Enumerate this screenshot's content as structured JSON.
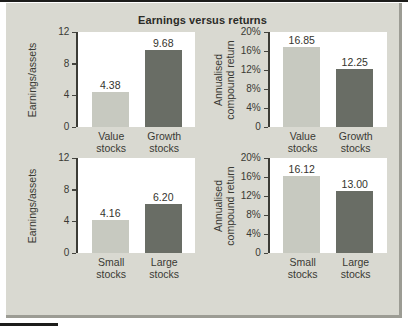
{
  "figure": {
    "title": "Earnings versus returns"
  },
  "colors": {
    "light_bar": "#c7c9c0",
    "dark_bar": "#696d65",
    "plot_bg": "#ffffff",
    "panel_bg": "#d9d9d1",
    "panel_border": "#9c9c94",
    "axis": "#3c3c36",
    "rule": "#1d1d1b"
  },
  "chart_data": [
    {
      "type": "bar",
      "title": "Earnings versus returns",
      "xlabel": "",
      "ylabel": "Earnings/assets",
      "categories": [
        "Value stocks",
        "Growth stocks"
      ],
      "values": [
        4.38,
        9.68
      ],
      "value_labels": [
        "4.38",
        "9.68"
      ],
      "bar_styles": [
        "light",
        "dark"
      ],
      "ylim": [
        0,
        12
      ],
      "yticks": [
        0,
        4,
        8,
        12
      ],
      "ytick_labels": [
        "0",
        "4",
        "8",
        "12"
      ],
      "grid": false,
      "legend": "none"
    },
    {
      "type": "bar",
      "title": "Earnings versus returns",
      "xlabel": "",
      "ylabel": "Annualised compound return",
      "categories": [
        "Value stocks",
        "Growth stocks"
      ],
      "values": [
        16.85,
        12.25
      ],
      "value_labels": [
        "16.85",
        "12.25"
      ],
      "bar_styles": [
        "light",
        "dark"
      ],
      "ylim": [
        0,
        20
      ],
      "yticks": [
        0,
        4,
        8,
        12,
        16,
        20
      ],
      "ytick_labels": [
        "0",
        "4%",
        "8%",
        "12%",
        "16%",
        "20%"
      ],
      "grid": false,
      "legend": "none"
    },
    {
      "type": "bar",
      "title": "Earnings versus returns",
      "xlabel": "",
      "ylabel": "Earnings/assets",
      "categories": [
        "Small stocks",
        "Large stocks"
      ],
      "values": [
        4.16,
        6.2
      ],
      "value_labels": [
        "4.16",
        "6.20"
      ],
      "bar_styles": [
        "light",
        "dark"
      ],
      "ylim": [
        0,
        12
      ],
      "yticks": [
        0,
        4,
        8,
        12
      ],
      "ytick_labels": [
        "0",
        "4",
        "8",
        "12"
      ],
      "grid": false,
      "legend": "none"
    },
    {
      "type": "bar",
      "title": "Earnings versus returns",
      "xlabel": "",
      "ylabel": "Annualised compound return",
      "categories": [
        "Small stocks",
        "Large stocks"
      ],
      "values": [
        16.12,
        13.0
      ],
      "value_labels": [
        "16.12",
        "13.00"
      ],
      "bar_styles": [
        "light",
        "dark"
      ],
      "ylim": [
        0,
        20
      ],
      "yticks": [
        0,
        4,
        8,
        12,
        16,
        20
      ],
      "ytick_labels": [
        "0",
        "4%",
        "8%",
        "12%",
        "16%",
        "20%"
      ],
      "grid": false,
      "legend": "none"
    }
  ]
}
